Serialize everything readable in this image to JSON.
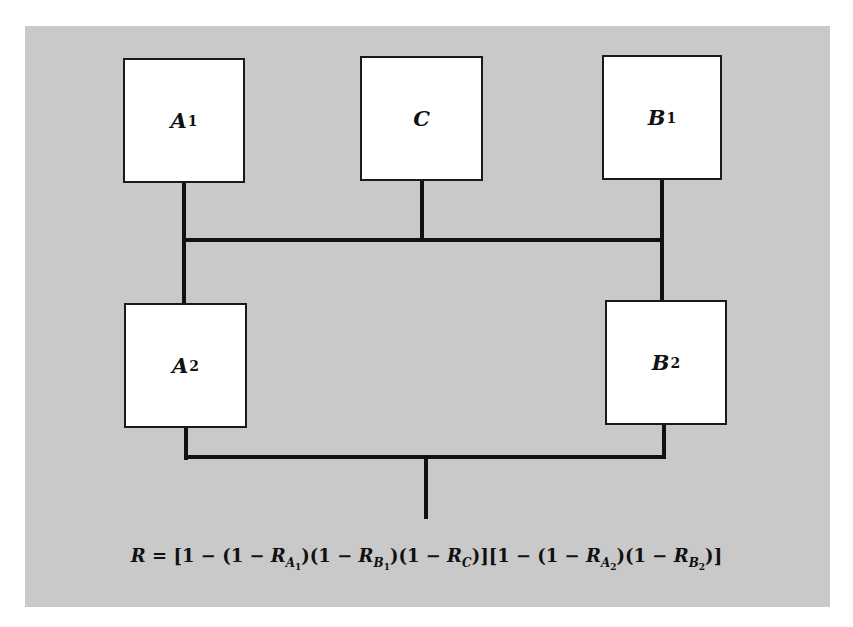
{
  "diagram": {
    "type": "reliability block diagram",
    "blocks": [
      {
        "id": "A1",
        "letter": "A",
        "sub": "1"
      },
      {
        "id": "C",
        "letter": "C",
        "sub": ""
      },
      {
        "id": "B1",
        "letter": "B",
        "sub": "1"
      },
      {
        "id": "A2",
        "letter": "A",
        "sub": "2"
      },
      {
        "id": "B2",
        "letter": "B",
        "sub": "2"
      }
    ],
    "connections": [
      "A1, C, B1 joined in parallel by upper bus",
      "Upper bus feeds A2 (left) and B2 (right)",
      "A2 and B2 joined in parallel by lower bus to output"
    ],
    "formula": {
      "lhs": "R",
      "eq": "=",
      "text": "R = [1 − (1 − R_A1)(1 − R_B1)(1 − R_C)][1 − (1 − R_A2)(1 − R_B2)]",
      "p1": "[1 − (1 − ",
      "p2": ")(1 − ",
      "p3": ")(1 − ",
      "p4": ")][1 − (1 − ",
      "p5": ")(1 − ",
      "p6": ")]",
      "terms": [
        {
          "letter": "R",
          "sub_letter": "A",
          "sub_num": "1"
        },
        {
          "letter": "R",
          "sub_letter": "B",
          "sub_num": "1"
        },
        {
          "letter": "R",
          "sub_letter": "C",
          "sub_num": ""
        },
        {
          "letter": "R",
          "sub_letter": "A",
          "sub_num": "2"
        },
        {
          "letter": "R",
          "sub_letter": "B",
          "sub_num": "2"
        }
      ]
    }
  }
}
